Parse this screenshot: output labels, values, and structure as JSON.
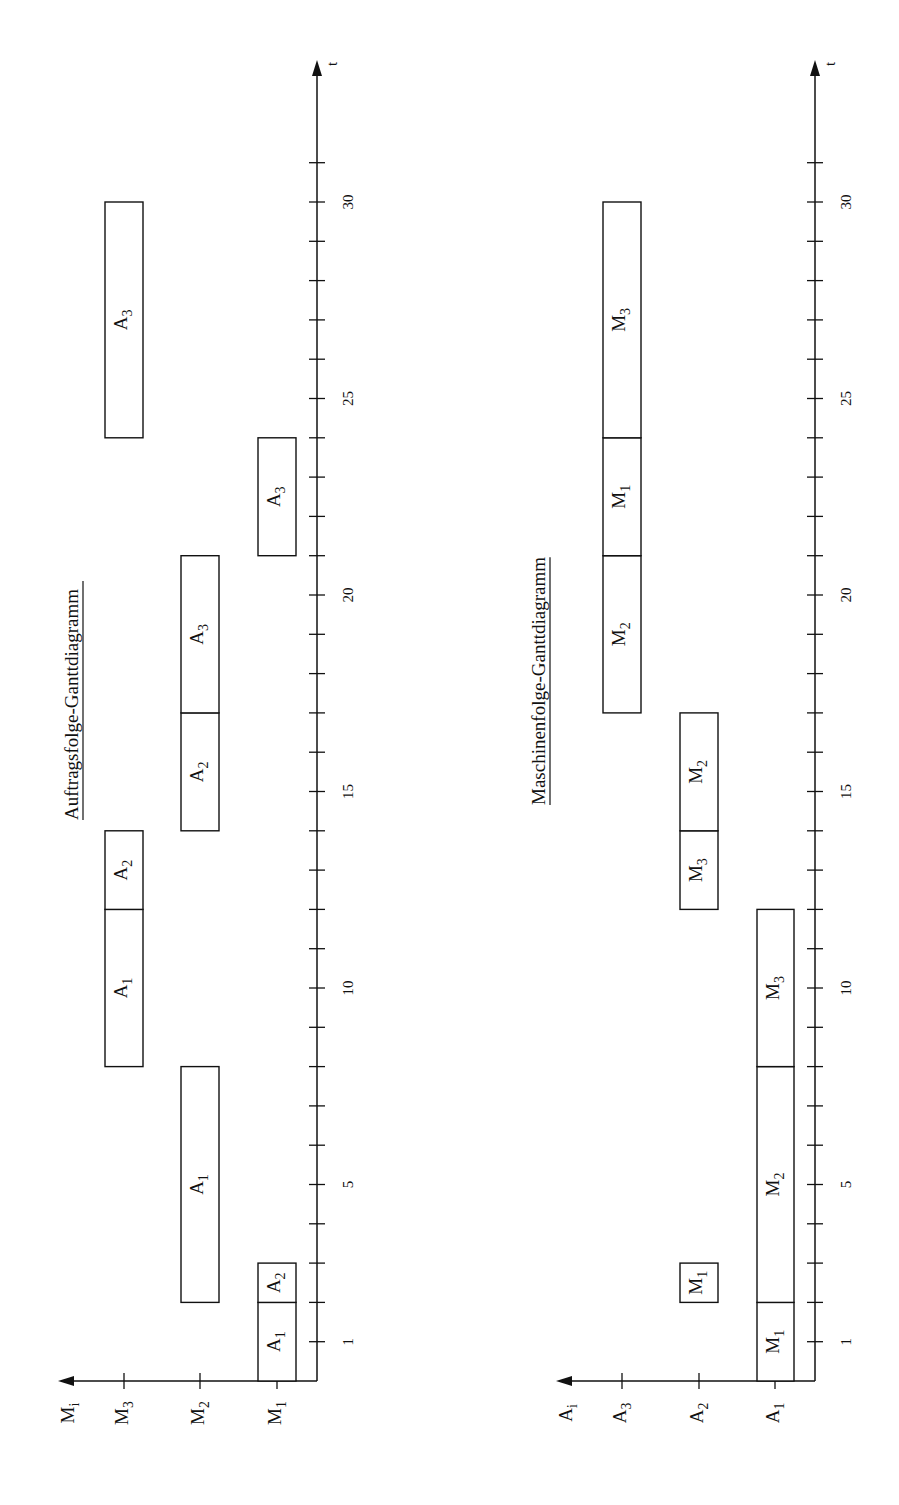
{
  "charts": [
    {
      "title": "Auftragsfolge-Ganttdiagramm",
      "y_axis_label": "M",
      "y_axis_sub": "i",
      "x_axis_label": "t",
      "rows": [
        {
          "label": "M",
          "sub": "1"
        },
        {
          "label": "M",
          "sub": "2"
        },
        {
          "label": "M",
          "sub": "3"
        }
      ],
      "tick_labels": [
        "1",
        "5",
        "10",
        "15",
        "20",
        "25",
        "30"
      ]
    },
    {
      "title": "Maschinenfolge-Ganttdiagramm",
      "y_axis_label": "A",
      "y_axis_sub": "i",
      "x_axis_label": "t",
      "rows": [
        {
          "label": "A",
          "sub": "1"
        },
        {
          "label": "A",
          "sub": "2"
        },
        {
          "label": "A",
          "sub": "3"
        }
      ],
      "tick_labels": [
        "1",
        "5",
        "10",
        "15",
        "20",
        "25",
        "30"
      ]
    }
  ],
  "chart_data": [
    {
      "type": "gantt",
      "title": "Auftragsfolge-Ganttdiagramm",
      "xlabel": "t",
      "ylabel": "M_i",
      "xlim": [
        0,
        32
      ],
      "categories": [
        "M1",
        "M2",
        "M3"
      ],
      "tasks": [
        {
          "row": "M1",
          "label": "A1",
          "start": 0,
          "end": 2
        },
        {
          "row": "M1",
          "label": "A2",
          "start": 2,
          "end": 3
        },
        {
          "row": "M1",
          "label": "A3",
          "start": 21,
          "end": 24
        },
        {
          "row": "M2",
          "label": "A1",
          "start": 2,
          "end": 8
        },
        {
          "row": "M2",
          "label": "A2",
          "start": 14,
          "end": 17
        },
        {
          "row": "M2",
          "label": "A3",
          "start": 17,
          "end": 21
        },
        {
          "row": "M3",
          "label": "A1",
          "start": 8,
          "end": 12
        },
        {
          "row": "M3",
          "label": "A2",
          "start": 12,
          "end": 14
        },
        {
          "row": "M3",
          "label": "A3",
          "start": 24,
          "end": 30
        }
      ],
      "x_ticks": [
        1,
        5,
        10,
        15,
        20,
        25,
        30
      ]
    },
    {
      "type": "gantt",
      "title": "Maschinenfolge-Ganttdiagramm",
      "xlabel": "t",
      "ylabel": "A_i",
      "xlim": [
        0,
        32
      ],
      "categories": [
        "A1",
        "A2",
        "A3"
      ],
      "tasks": [
        {
          "row": "A1",
          "label": "M1",
          "start": 0,
          "end": 2
        },
        {
          "row": "A1",
          "label": "M2",
          "start": 2,
          "end": 8
        },
        {
          "row": "A1",
          "label": "M3",
          "start": 8,
          "end": 12
        },
        {
          "row": "A2",
          "label": "M1",
          "start": 2,
          "end": 3
        },
        {
          "row": "A2",
          "label": "M3",
          "start": 12,
          "end": 14
        },
        {
          "row": "A2",
          "label": "M2",
          "start": 14,
          "end": 17
        },
        {
          "row": "A3",
          "label": "M2",
          "start": 17,
          "end": 21
        },
        {
          "row": "A3",
          "label": "M1",
          "start": 21,
          "end": 24
        },
        {
          "row": "A3",
          "label": "M3",
          "start": 24,
          "end": 30
        }
      ],
      "x_ticks": [
        1,
        5,
        10,
        15,
        20,
        25,
        30
      ]
    }
  ]
}
